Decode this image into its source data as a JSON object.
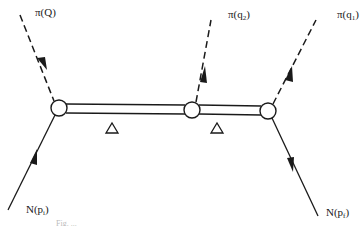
{
  "diagram": {
    "type": "feynman-diagram",
    "labels": {
      "pi_Q": {
        "base": "π(Q)",
        "sub": ""
      },
      "pi_q2": {
        "base": "π(q",
        "sub": "2",
        "close": ")"
      },
      "pi_q1": {
        "base": "π(q",
        "sub": "1",
        "close": ")"
      },
      "N_pi": {
        "base": "N(p",
        "sub": "i",
        "close": ")"
      },
      "N_pf": {
        "base": "N(p",
        "sub": "f",
        "close": ")"
      },
      "delta_1": "Δ",
      "delta_2": "Δ"
    },
    "vertices": [
      {
        "id": "v1",
        "x": 59,
        "y": 108
      },
      {
        "id": "v2",
        "x": 192,
        "y": 110
      },
      {
        "id": "v3",
        "x": 268,
        "y": 111
      }
    ],
    "lines": [
      {
        "id": "pion-Q",
        "style": "dashed",
        "from": [
          20,
          15
        ],
        "to": "v1",
        "arrow": "toward-vertex"
      },
      {
        "id": "pion-q2",
        "style": "dashed",
        "from": "v2",
        "to": [
          211,
          20
        ],
        "arrow": "away-from-vertex"
      },
      {
        "id": "pion-q1",
        "style": "dashed",
        "from": "v3",
        "to": [
          316,
          20
        ],
        "arrow": "away-from-vertex"
      },
      {
        "id": "nucleon-in",
        "style": "solid",
        "from": [
          8,
          210
        ],
        "to": "v1",
        "arrow": "toward-vertex"
      },
      {
        "id": "nucleon-out",
        "style": "solid",
        "from": "v3",
        "to": [
          318,
          216
        ],
        "arrow": "away-from-vertex"
      },
      {
        "id": "delta-prop-1",
        "style": "double",
        "from": "v1",
        "to": "v2"
      },
      {
        "id": "delta-prop-2",
        "style": "double",
        "from": "v2",
        "to": "v3"
      }
    ],
    "caption": "Fig. ..."
  }
}
